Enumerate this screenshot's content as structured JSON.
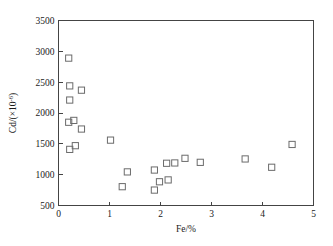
{
  "chart_data": {
    "type": "scatter",
    "title": "",
    "xlabel": "Fe/%",
    "ylabel": "Cd/(×10⁻⁶)",
    "xlim": [
      0,
      5
    ],
    "ylim": [
      500,
      3500
    ],
    "xticks": [
      "0",
      "1",
      "2",
      "3",
      "4",
      "5"
    ],
    "xtick_values": [
      0,
      1,
      2,
      3,
      4,
      5
    ],
    "yticks": [
      "500",
      "1000",
      "1500",
      "2000",
      "2500",
      "3000",
      "3500"
    ],
    "ytick_values": [
      500,
      1000,
      1500,
      2000,
      2500,
      3000,
      3500
    ],
    "grid": false,
    "legend": null,
    "legend_position": "none",
    "marker": "open-square",
    "marker_color": "#6b6b6b",
    "series": [
      {
        "name": "Cd vs Fe",
        "points": [
          [
            0.2,
            2890
          ],
          [
            0.22,
            2440
          ],
          [
            0.22,
            2210
          ],
          [
            0.45,
            2370
          ],
          [
            0.2,
            1850
          ],
          [
            0.3,
            1880
          ],
          [
            0.45,
            1740
          ],
          [
            0.22,
            1410
          ],
          [
            0.33,
            1470
          ],
          [
            1.02,
            1560
          ],
          [
            1.25,
            805
          ],
          [
            1.35,
            1045
          ],
          [
            1.88,
            1075
          ],
          [
            1.88,
            750
          ],
          [
            1.98,
            885
          ],
          [
            2.12,
            1185
          ],
          [
            2.15,
            915
          ],
          [
            2.28,
            1190
          ],
          [
            2.48,
            1265
          ],
          [
            2.78,
            1200
          ],
          [
            3.66,
            1255
          ],
          [
            4.18,
            1120
          ],
          [
            4.58,
            1490
          ]
        ]
      }
    ]
  },
  "figure": {
    "ylabel_parts": {
      "base": "Cd/(×10",
      "exponent": "-6",
      "close": ")"
    }
  }
}
